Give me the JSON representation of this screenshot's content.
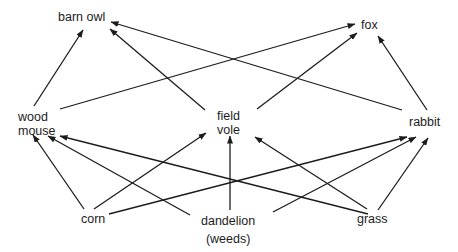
{
  "diagram": {
    "type": "food web",
    "colors": {
      "line": "#1c1c1c",
      "background": "#ffffff"
    },
    "nodes": [
      {
        "id": "barn_owl",
        "label_lines": [
          "barn owl"
        ],
        "level": "top predator",
        "x": 58,
        "y": 10
      },
      {
        "id": "fox",
        "label_lines": [
          "fox"
        ],
        "level": "top predator",
        "x": 361,
        "y": 18
      },
      {
        "id": "wood_mouse",
        "label_lines": [
          "wood",
          "mouse"
        ],
        "level": "primary consumer",
        "x": 18,
        "y": 110
      },
      {
        "id": "field_vole",
        "label_lines": [
          "field",
          "vole"
        ],
        "level": "primary consumer",
        "x": 217,
        "y": 109
      },
      {
        "id": "rabbit",
        "label_lines": [
          "rabbit"
        ],
        "level": "primary consumer",
        "x": 409,
        "y": 115
      },
      {
        "id": "corn",
        "label_lines": [
          "corn"
        ],
        "level": "producer",
        "x": 81,
        "y": 212
      },
      {
        "id": "dandelion",
        "label_lines": [
          "dandelion",
          "(weeds)"
        ],
        "level": "producer",
        "x": 201,
        "y": 212
      },
      {
        "id": "grass",
        "label_lines": [
          "grass"
        ],
        "level": "producer",
        "x": 357,
        "y": 212
      }
    ],
    "edges": [
      {
        "from": "wood_mouse",
        "to": "barn_owl",
        "x1": 34,
        "y1": 106,
        "x2": 83,
        "y2": 30
      },
      {
        "from": "field_vole",
        "to": "barn_owl",
        "x1": 205,
        "y1": 110,
        "x2": 110,
        "y2": 29
      },
      {
        "from": "rabbit",
        "to": "barn_owl",
        "x1": 402,
        "y1": 110,
        "x2": 111,
        "y2": 22
      },
      {
        "from": "wood_mouse",
        "to": "fox",
        "x1": 60,
        "y1": 109,
        "x2": 355,
        "y2": 24
      },
      {
        "from": "field_vole",
        "to": "fox",
        "x1": 257,
        "y1": 109,
        "x2": 357,
        "y2": 33
      },
      {
        "from": "rabbit",
        "to": "fox",
        "x1": 427,
        "y1": 110,
        "x2": 378,
        "y2": 36
      },
      {
        "from": "corn",
        "to": "wood_mouse",
        "x1": 84,
        "y1": 209,
        "x2": 33,
        "y2": 135
      },
      {
        "from": "dandelion",
        "to": "wood_mouse",
        "x1": 190,
        "y1": 215,
        "x2": 48,
        "y2": 136
      },
      {
        "from": "grass",
        "to": "wood_mouse",
        "x1": 368,
        "y1": 214,
        "x2": 60,
        "y2": 136
      },
      {
        "from": "corn",
        "to": "field_vole",
        "x1": 94,
        "y1": 209,
        "x2": 206,
        "y2": 133
      },
      {
        "from": "dandelion",
        "to": "field_vole",
        "x1": 230,
        "y1": 210,
        "x2": 230,
        "y2": 136
      },
      {
        "from": "grass",
        "to": "field_vole",
        "x1": 367,
        "y1": 209,
        "x2": 255,
        "y2": 137
      },
      {
        "from": "corn",
        "to": "rabbit",
        "x1": 109,
        "y1": 214,
        "x2": 407,
        "y2": 137
      },
      {
        "from": "dandelion",
        "to": "rabbit",
        "x1": 273,
        "y1": 212,
        "x2": 416,
        "y2": 137
      },
      {
        "from": "grass",
        "to": "rabbit",
        "x1": 378,
        "y1": 210,
        "x2": 428,
        "y2": 138
      }
    ]
  }
}
